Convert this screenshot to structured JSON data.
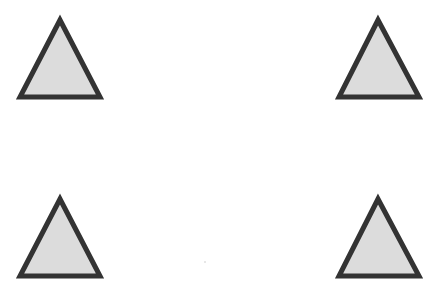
{
  "canvas": {
    "width": 445,
    "height": 285,
    "background": "#ffffff"
  },
  "style": {
    "fill": "#dcdcdc",
    "stroke": "#333333",
    "stroke_width": 5
  },
  "shapes": [
    {
      "name": "triangle-top-left",
      "type": "triangle",
      "points": "60,20 20,97 100,97"
    },
    {
      "name": "triangle-top-right",
      "type": "triangle",
      "points": "378,20 339,97 419,97"
    },
    {
      "name": "triangle-bottom-left",
      "type": "triangle",
      "points": "60,199 20,276 100,276"
    },
    {
      "name": "triangle-bottom-right",
      "type": "triangle",
      "points": "378,199 339,276 419,276"
    }
  ]
}
